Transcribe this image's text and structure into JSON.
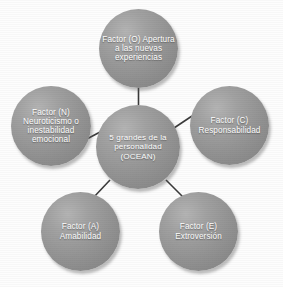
{
  "diagram": {
    "type": "hub-and-spoke",
    "title_node": "center",
    "colors": {
      "background": "#fdfdfd",
      "node_fill": "#949494",
      "node_fill_highlight": "#b4b4b4",
      "node_fill_shadow": "#7e7e7e",
      "node_text": "#ffffff",
      "connector": "#3a3a3a"
    },
    "center": {
      "id": "center",
      "label": "5 grandes de la personalidad (OCEAN)",
      "lines": [
        "5",
        "grandes de",
        "la",
        "personalidad",
        "(OCEAN)"
      ]
    },
    "nodes": [
      {
        "id": "openness",
        "label": "Factor (O) Apertura a las nuevas experiencias",
        "lines": [
          "Factor (O)",
          "Apertura a",
          "las nuevas",
          "experiencias"
        ],
        "position": "top"
      },
      {
        "id": "conscientiousness",
        "label": "Factor (C) Responsabilidad",
        "lines": [
          "Factor (C)",
          "Responsabi",
          "lidad"
        ],
        "position": "right"
      },
      {
        "id": "extraversion",
        "label": "Factor (E) Extroversión",
        "lines": [
          "Factor (E)",
          "Extroversión"
        ],
        "position": "bottom-right"
      },
      {
        "id": "agreeableness",
        "label": "Factor (A) Amabilidad",
        "lines": [
          "Factor (A)",
          "Amabilidad"
        ],
        "position": "bottom-left"
      },
      {
        "id": "neuroticism",
        "label": "Factor (N) Neuroticismo o inestabilidad emocional",
        "lines": [
          "Factor (N)",
          "Neuroticismo",
          "o",
          "inestabilidad",
          "emocional"
        ],
        "position": "left"
      }
    ],
    "connectors": [
      {
        "id": "center-openness",
        "from": "center",
        "to": "openness"
      },
      {
        "id": "center-conscientiousness",
        "from": "center",
        "to": "conscientiousness"
      },
      {
        "id": "center-extraversion",
        "from": "center",
        "to": "extraversion"
      },
      {
        "id": "center-agreeableness",
        "from": "center",
        "to": "agreeableness"
      },
      {
        "id": "center-neuroticism",
        "from": "center",
        "to": "neuroticism"
      }
    ]
  }
}
